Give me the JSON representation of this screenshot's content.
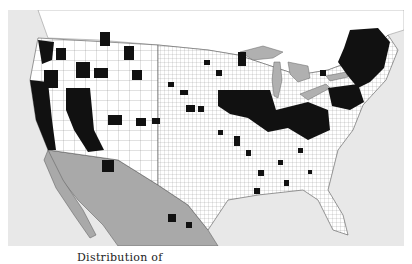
{
  "map": {
    "title": "Distribution of ...",
    "caption_visible": "Distribution of",
    "type": "county-level presence map",
    "region": "Contiguous United States",
    "legend": {
      "present": "black-filled county",
      "absent": "white county",
      "other_land": "gray (Mexico / Canada waters)",
      "water": "light gray"
    },
    "colors": {
      "ocean": "#e8e8e8",
      "county": "#ffffff",
      "present": "#111111",
      "outside": "#a9a9a9",
      "lakes": "#b0b0b0",
      "borders": "#555555"
    },
    "concentrations": [
      "Pacific coast (California, Oregon, Washington)",
      "Great Basin / Nevada / Arizona",
      "Northern Rockies (Idaho, Montana)",
      "Midwest corn belt (Illinois, Indiana, Ohio, Iowa)",
      "Northeast / New England (Maine, New York, Pennsylvania)",
      "Scattered Southeast counties"
    ]
  }
}
